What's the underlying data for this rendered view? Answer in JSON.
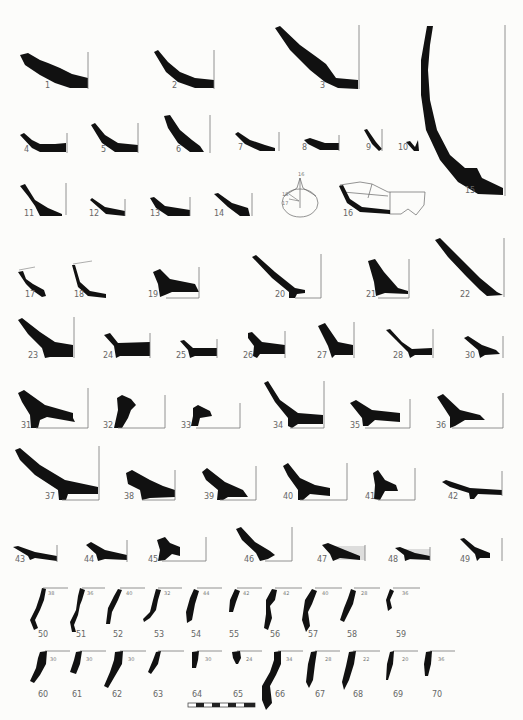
{
  "plate": {
    "type": "pottery profile drawings (base and rim sherds)",
    "background": "#fcfcfa",
    "ink": "#111111"
  },
  "figures": [
    {
      "n": "1",
      "x": 45,
      "y": 88
    },
    {
      "n": "2",
      "x": 172,
      "y": 88
    },
    {
      "n": "3",
      "x": 320,
      "y": 88
    },
    {
      "n": "4",
      "x": 24,
      "y": 152
    },
    {
      "n": "5",
      "x": 101,
      "y": 152
    },
    {
      "n": "6",
      "x": 176,
      "y": 152
    },
    {
      "n": "7",
      "x": 238,
      "y": 150
    },
    {
      "n": "8",
      "x": 302,
      "y": 150
    },
    {
      "n": "9",
      "x": 366,
      "y": 150
    },
    {
      "n": "10",
      "x": 398,
      "y": 150
    },
    {
      "n": "11",
      "x": 24,
      "y": 216
    },
    {
      "n": "12",
      "x": 89,
      "y": 216
    },
    {
      "n": "13",
      "x": 150,
      "y": 216
    },
    {
      "n": "14",
      "x": 214,
      "y": 216
    },
    {
      "n": "15",
      "x": 465,
      "y": 193
    },
    {
      "n": "16",
      "x": 343,
      "y": 216
    },
    {
      "n": "17",
      "x": 25,
      "y": 297
    },
    {
      "n": "18",
      "x": 74,
      "y": 297
    },
    {
      "n": "19",
      "x": 148,
      "y": 297
    },
    {
      "n": "20",
      "x": 275,
      "y": 297
    },
    {
      "n": "21",
      "x": 366,
      "y": 297
    },
    {
      "n": "22",
      "x": 460,
      "y": 297
    },
    {
      "n": "23",
      "x": 28,
      "y": 358
    },
    {
      "n": "24",
      "x": 103,
      "y": 358
    },
    {
      "n": "25",
      "x": 176,
      "y": 358
    },
    {
      "n": "26",
      "x": 243,
      "y": 358
    },
    {
      "n": "27",
      "x": 317,
      "y": 358
    },
    {
      "n": "28",
      "x": 393,
      "y": 358
    },
    {
      "n": "30",
      "x": 465,
      "y": 358
    },
    {
      "n": "31",
      "x": 21,
      "y": 428
    },
    {
      "n": "32",
      "x": 103,
      "y": 428
    },
    {
      "n": "33",
      "x": 181,
      "y": 428
    },
    {
      "n": "34",
      "x": 273,
      "y": 428
    },
    {
      "n": "35",
      "x": 350,
      "y": 428
    },
    {
      "n": "36",
      "x": 436,
      "y": 428
    },
    {
      "n": "37",
      "x": 45,
      "y": 499
    },
    {
      "n": "38",
      "x": 124,
      "y": 499
    },
    {
      "n": "39",
      "x": 204,
      "y": 499
    },
    {
      "n": "40",
      "x": 283,
      "y": 499
    },
    {
      "n": "41",
      "x": 365,
      "y": 499
    },
    {
      "n": "42",
      "x": 448,
      "y": 499
    },
    {
      "n": "43",
      "x": 15,
      "y": 562
    },
    {
      "n": "44",
      "x": 84,
      "y": 562
    },
    {
      "n": "45",
      "x": 148,
      "y": 562
    },
    {
      "n": "46",
      "x": 244,
      "y": 562
    },
    {
      "n": "47",
      "x": 317,
      "y": 562
    },
    {
      "n": "48",
      "x": 388,
      "y": 562
    },
    {
      "n": "49",
      "x": 460,
      "y": 562
    },
    {
      "n": "50",
      "x": 38,
      "y": 637
    },
    {
      "n": "51",
      "x": 76,
      "y": 637
    },
    {
      "n": "52",
      "x": 113,
      "y": 637
    },
    {
      "n": "53",
      "x": 154,
      "y": 637
    },
    {
      "n": "54",
      "x": 191,
      "y": 637
    },
    {
      "n": "55",
      "x": 229,
      "y": 637
    },
    {
      "n": "56",
      "x": 270,
      "y": 637
    },
    {
      "n": "57",
      "x": 308,
      "y": 637
    },
    {
      "n": "58",
      "x": 347,
      "y": 637
    },
    {
      "n": "59",
      "x": 396,
      "y": 637
    },
    {
      "n": "60",
      "x": 38,
      "y": 697
    },
    {
      "n": "61",
      "x": 72,
      "y": 697
    },
    {
      "n": "62",
      "x": 112,
      "y": 697
    },
    {
      "n": "63",
      "x": 153,
      "y": 697
    },
    {
      "n": "64",
      "x": 192,
      "y": 697
    },
    {
      "n": "65",
      "x": 233,
      "y": 697
    },
    {
      "n": "66",
      "x": 275,
      "y": 697
    },
    {
      "n": "67",
      "x": 315,
      "y": 697
    },
    {
      "n": "68",
      "x": 353,
      "y": 697
    },
    {
      "n": "69",
      "x": 393,
      "y": 697
    },
    {
      "n": "70",
      "x": 432,
      "y": 697
    }
  ],
  "rim_diameters": [
    {
      "fig": "50",
      "d": "38",
      "x": 48,
      "y": 595
    },
    {
      "fig": "51",
      "d": "36",
      "x": 87,
      "y": 595
    },
    {
      "fig": "52",
      "d": "40",
      "x": 126,
      "y": 595
    },
    {
      "fig": "53",
      "d": "32",
      "x": 164,
      "y": 595
    },
    {
      "fig": "54",
      "d": "44",
      "x": 203,
      "y": 595
    },
    {
      "fig": "55",
      "d": "42",
      "x": 243,
      "y": 595
    },
    {
      "fig": "56",
      "d": "42",
      "x": 283,
      "y": 595
    },
    {
      "fig": "57",
      "d": "40",
      "x": 322,
      "y": 595
    },
    {
      "fig": "58",
      "d": "28",
      "x": 361,
      "y": 595
    },
    {
      "fig": "59",
      "d": "36",
      "x": 402,
      "y": 595
    },
    {
      "fig": "60",
      "d": "30",
      "x": 50,
      "y": 661
    },
    {
      "fig": "61",
      "d": "30",
      "x": 86,
      "y": 661
    },
    {
      "fig": "62",
      "d": "30",
      "x": 128,
      "y": 661
    },
    {
      "fig": "64",
      "d": "30",
      "x": 205,
      "y": 661
    },
    {
      "fig": "65",
      "d": "24",
      "x": 246,
      "y": 661
    },
    {
      "fig": "66",
      "d": "34",
      "x": 286,
      "y": 661
    },
    {
      "fig": "67",
      "d": "28",
      "x": 325,
      "y": 661
    },
    {
      "fig": "68",
      "d": "22",
      "x": 363,
      "y": 661
    },
    {
      "fig": "69",
      "d": "20",
      "x": 402,
      "y": 661
    },
    {
      "fig": "70",
      "d": "36",
      "x": 438,
      "y": 661
    }
  ],
  "inset_vessel": {
    "labels": [
      {
        "t": "16",
        "x": 300,
        "y": 170
      },
      {
        "t": "18",
        "x": 286,
        "y": 187
      },
      {
        "t": "17",
        "x": 286,
        "y": 197
      }
    ]
  },
  "scale_bar": {
    "x": 188,
    "y": 703,
    "width": 67,
    "segments": 8
  }
}
